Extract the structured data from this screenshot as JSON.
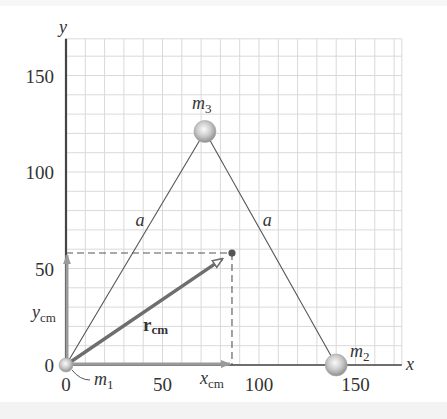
{
  "figure": {
    "axes": {
      "x_label": "x",
      "y_label": "y",
      "x_ticks": [
        {
          "value": 0,
          "label": "0"
        },
        {
          "value": 50,
          "label": "50"
        },
        {
          "value": 100,
          "label": "100"
        },
        {
          "value": 150,
          "label": "150"
        }
      ],
      "y_ticks": [
        {
          "value": 0,
          "label": "0"
        },
        {
          "value": 50,
          "label": "50"
        },
        {
          "value": 100,
          "label": "100"
        },
        {
          "value": 150,
          "label": "150"
        }
      ],
      "grid_step": 10,
      "x_max": 174,
      "y_max": 169
    },
    "masses": [
      {
        "id": "m1",
        "label": "m",
        "subscript": "1",
        "x": 0,
        "y": 0
      },
      {
        "id": "m2",
        "label": "m",
        "subscript": "2",
        "x": 140,
        "y": 0
      },
      {
        "id": "m3",
        "label": "m",
        "subscript": "3",
        "x": 72,
        "y": 121
      }
    ],
    "side_labels": [
      {
        "text": "a",
        "x": 36,
        "y": 75
      },
      {
        "text": "a",
        "x": 102,
        "y": 75
      }
    ],
    "center_of_mass": {
      "x": 86,
      "y": 58
    },
    "vector": {
      "label": "r",
      "subscript": "cm"
    },
    "component_labels": {
      "x": {
        "label": "x",
        "subscript": "cm"
      },
      "y": {
        "label": "y",
        "subscript": "cm"
      }
    },
    "colors": {
      "grid": "#d9d9d9",
      "axis": "#444444",
      "triangle": "#555555",
      "vector": "#6e6e6e",
      "component_arrow": "#9a9a9a",
      "dashed": "#555555",
      "sphere_light": "#f2f2f2",
      "sphere_dark": "#9c9c9c",
      "cm_dot": "#555555"
    }
  }
}
